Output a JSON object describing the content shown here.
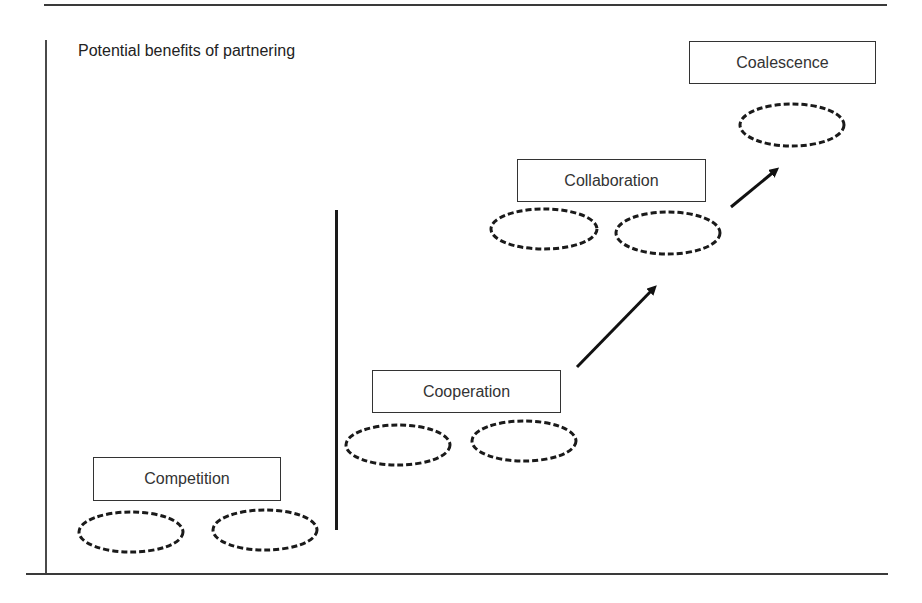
{
  "diagram": {
    "title": "Potential benefits of partnering",
    "stages": [
      {
        "label": "Competition",
        "ellipse_count": 2
      },
      {
        "label": "Cooperation",
        "ellipse_count": 2
      },
      {
        "label": "Collaboration",
        "ellipse_count": 2
      },
      {
        "label": "Coalescence",
        "ellipse_count": 1
      }
    ],
    "arrows": [
      {
        "from": "Cooperation",
        "to": "Collaboration"
      },
      {
        "from": "Collaboration",
        "to": "Coalescence"
      }
    ],
    "colors": {
      "line": "#1a1a1a",
      "box_border": "#333333",
      "background": "#ffffff"
    }
  }
}
